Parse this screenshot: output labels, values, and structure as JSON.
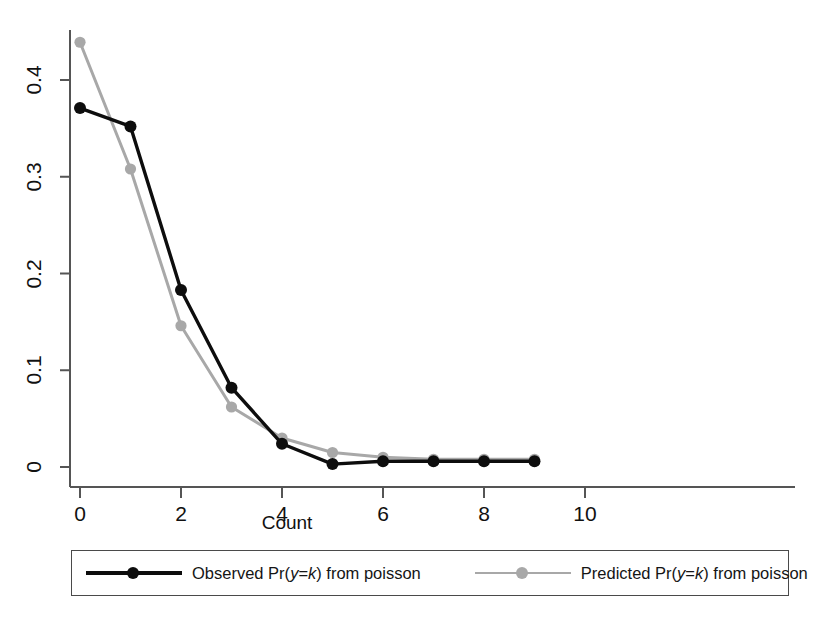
{
  "chart_data": {
    "type": "line",
    "title": "",
    "subtitle": "",
    "xlabel": "Count",
    "ylabel": "",
    "x": [
      0,
      1,
      2,
      3,
      4,
      5,
      6,
      7,
      8,
      9
    ],
    "xlim": [
      0,
      10
    ],
    "ylim": [
      0,
      0.46
    ],
    "xticks": [
      0,
      2,
      4,
      6,
      8,
      10
    ],
    "xticklabels": [
      "0",
      "2",
      "4",
      "6",
      "8",
      "10"
    ],
    "yticks": [
      0,
      0.1,
      0.2,
      0.3,
      0.4
    ],
    "yticklabels": [
      "0",
      "0.1",
      "0.2",
      "0.3",
      "0.4"
    ],
    "grid": false,
    "legend_position": "below-axes",
    "series": [
      {
        "name": "Observed Pr(y=k) from poisson",
        "color": "#0d0d0d",
        "marker": "filled-circle",
        "values": [
          0.371,
          0.352,
          0.183,
          0.082,
          0.024,
          0.003,
          0.006,
          0.006,
          0.006,
          0.006
        ]
      },
      {
        "name": "Predicted Pr(y=k) from poisson",
        "color": "#a8a8a8",
        "marker": "filled-circle",
        "values": [
          0.439,
          0.308,
          0.146,
          0.062,
          0.03,
          0.015,
          0.01,
          0.008,
          0.008,
          0.008
        ]
      }
    ],
    "legend": [
      {
        "label_prefix": "Observed Pr(",
        "label_y": "y",
        "label_eq": "=",
        "label_k": "k",
        "label_suffix": ") from poisson",
        "color": "#0d0d0d"
      },
      {
        "label_prefix": "Predicted Pr(",
        "label_y": "y",
        "label_eq": "=",
        "label_k": "k",
        "label_suffix": ") from poisson",
        "color": "#a8a8a8"
      }
    ]
  },
  "axes": {
    "x_title": "Count",
    "x_tick_0": "0",
    "x_tick_1": "2",
    "x_tick_2": "4",
    "x_tick_3": "6",
    "x_tick_4": "8",
    "x_tick_5": "10",
    "y_tick_0": "0",
    "y_tick_1": "0.1",
    "y_tick_2": "0.2",
    "y_tick_3": "0.3",
    "y_tick_4": "0.4"
  },
  "legend": {
    "entry1_prefix": "Observed Pr(",
    "entry1_y": "y",
    "entry1_eq": "=",
    "entry1_k": "k",
    "entry1_suffix": ") from poisson",
    "entry2_prefix": "Predicted Pr(",
    "entry2_y": "y",
    "entry2_eq": "=",
    "entry2_k": "k",
    "entry2_suffix": ") from poisson"
  },
  "colors": {
    "observed": "#0d0d0d",
    "predicted": "#a8a8a8",
    "axis": "#555555",
    "legend_border": "#4a4a4a"
  }
}
